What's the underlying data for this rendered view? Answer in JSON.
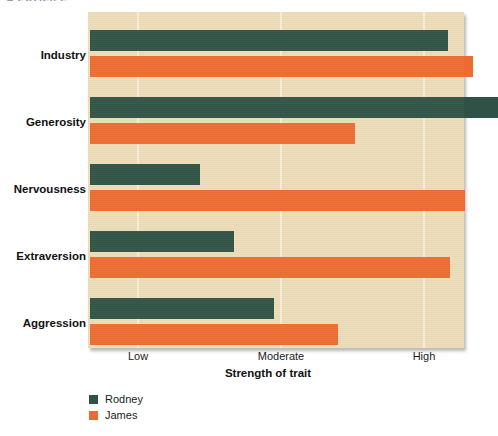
{
  "figure": {
    "title_clipped": "A PROFILE"
  },
  "legend": {
    "position": "below-left",
    "entries": [
      {
        "name": "Rodney",
        "color": "#2e5245"
      },
      {
        "name": "James",
        "color": "#ed6a31"
      }
    ]
  },
  "axis": {
    "xlabel": "Strength of trait",
    "ticks": [
      "Low",
      "Moderate",
      "High"
    ]
  },
  "chart_data": {
    "type": "bar",
    "orientation": "horizontal",
    "title": "A PROFILE",
    "xlabel": "Strength of trait",
    "ylabel": "",
    "categories": [
      "Industry",
      "Generosity",
      "Nervousness",
      "Extraversion",
      "Aggression"
    ],
    "xtick_labels": [
      "Low",
      "Moderate",
      "High"
    ],
    "xtick_values": [
      1,
      2,
      3
    ],
    "xlim": [
      0.65,
      3.28
    ],
    "grid": true,
    "grid_axis": "x",
    "legend_position": "bottom-left",
    "series": [
      {
        "name": "Rodney",
        "color": "#2e5245",
        "values": [
          3.17,
          3.52,
          1.43,
          1.67,
          1.95
        ]
      },
      {
        "name": "James",
        "color": "#ed6a31",
        "values": [
          3.34,
          2.52,
          3.29,
          3.18,
          2.4
        ]
      }
    ],
    "background_color": "#ecddb8"
  }
}
